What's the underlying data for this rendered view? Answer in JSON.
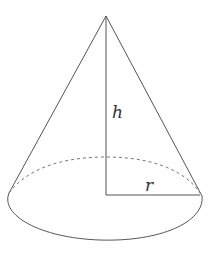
{
  "diagram": {
    "type": "cone",
    "labels": {
      "height": "h",
      "radius": "r"
    },
    "colors": {
      "stroke": "#555555",
      "dashed": "#777777",
      "label": "#333333",
      "background": "#ffffff"
    },
    "geometry": {
      "apex": [
        106,
        16
      ],
      "base_left": [
        9,
        194
      ],
      "base_right": [
        202,
        196
      ],
      "center": [
        106,
        195
      ],
      "ellipse_top_y": 157,
      "ellipse_bottom_y": 240
    }
  }
}
